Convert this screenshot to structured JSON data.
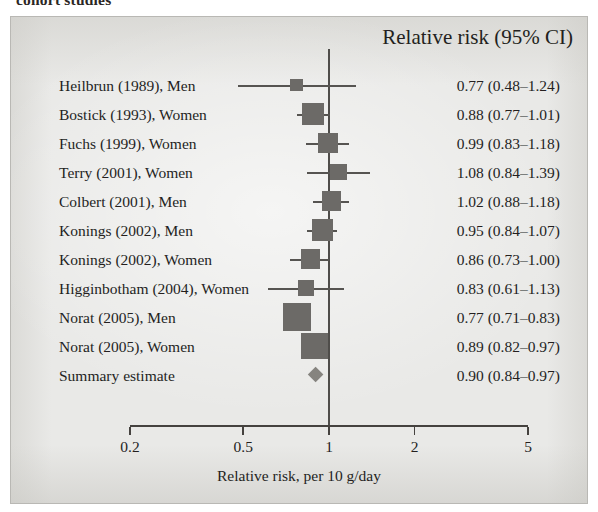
{
  "caption_fragment": "cohort studies",
  "header": {
    "value_column": "Relative risk (95% CI)"
  },
  "axis": {
    "title": "Relative risk, per 10 g/day",
    "ticks": [
      "0.2",
      "0.5",
      "1",
      "2",
      "5"
    ],
    "tick_values": [
      0.2,
      0.5,
      1,
      2,
      5
    ],
    "scale": "log",
    "range": [
      0.2,
      5
    ],
    "null_value": 1
  },
  "colors": {
    "panel_background": "#e9e9e7",
    "panel_border": "#b9b8b4",
    "text": "#231f20",
    "marker": "#6c6a67",
    "ci_line": "#565451",
    "diamond": "#86847f",
    "axis": "#45423f"
  },
  "chart_data": {
    "type": "forest",
    "title": "Relative risk (95% CI)",
    "xlabel": "Relative risk, per 10 g/day",
    "ylabel": "",
    "xscale": "log",
    "xlim": [
      0.2,
      5
    ],
    "xticks": [
      0.2,
      0.5,
      1,
      2,
      5
    ],
    "xticklabels": [
      "0.2",
      "0.5",
      "1",
      "2",
      "5"
    ],
    "reference_line": 1,
    "grid": false,
    "legend": "none",
    "rows": [
      {
        "label": "Heilbrun (1989), Men",
        "value": "0.77 (0.48–1.24)",
        "estimate": 0.77,
        "lower": 0.48,
        "upper": 1.24,
        "weight": 0.18,
        "type": "study"
      },
      {
        "label": "Bostick (1993), Women",
        "value": "0.88 (0.77–1.01)",
        "estimate": 0.88,
        "lower": 0.77,
        "upper": 1.01,
        "weight": 0.7,
        "type": "study"
      },
      {
        "label": "Fuchs (1999), Women",
        "value": "0.99 (0.83–1.18)",
        "estimate": 0.99,
        "lower": 0.83,
        "upper": 1.18,
        "weight": 0.58,
        "type": "study"
      },
      {
        "label": "Terry (2001), Women",
        "value": "1.08 (0.84–1.39)",
        "estimate": 1.08,
        "lower": 0.84,
        "upper": 1.39,
        "weight": 0.4,
        "type": "study"
      },
      {
        "label": "Colbert (2001), Men",
        "value": "1.02 (0.88–1.18)",
        "estimate": 1.02,
        "lower": 0.88,
        "upper": 1.18,
        "weight": 0.56,
        "type": "study"
      },
      {
        "label": "Konings (2002), Men",
        "value": "0.95 (0.84–1.07)",
        "estimate": 0.95,
        "lower": 0.84,
        "upper": 1.07,
        "weight": 0.66,
        "type": "study"
      },
      {
        "label": "Konings (2002), Women",
        "value": "0.86 (0.73–1.00)",
        "estimate": 0.86,
        "lower": 0.73,
        "upper": 1.0,
        "weight": 0.56,
        "type": "study"
      },
      {
        "label": "Higginbotham (2004), Women",
        "value": "0.83 (0.61–1.13)",
        "estimate": 0.83,
        "lower": 0.61,
        "upper": 1.13,
        "weight": 0.33,
        "type": "study"
      },
      {
        "label": "Norat (2005), Men",
        "value": "0.77 (0.71–0.83)",
        "estimate": 0.77,
        "lower": 0.71,
        "upper": 0.83,
        "weight": 1.0,
        "type": "study"
      },
      {
        "label": "Norat (2005), Women",
        "value": "0.89 (0.82–0.97)",
        "estimate": 0.89,
        "lower": 0.82,
        "upper": 0.97,
        "weight": 0.92,
        "type": "study"
      },
      {
        "label": "Summary estimate",
        "value": "0.90 (0.84–0.97)",
        "estimate": 0.9,
        "lower": 0.84,
        "upper": 0.97,
        "weight": 0.4,
        "type": "summary"
      }
    ]
  }
}
